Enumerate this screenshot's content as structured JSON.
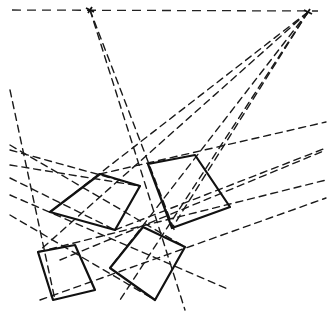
{
  "diagram": {
    "title": "",
    "stroke_color": "#111111",
    "background": "#ffffff",
    "horizon": {
      "x1": 12,
      "y1": 10,
      "x2": 318,
      "y2": 11
    },
    "vanishing_points": [
      {
        "name": "vp-left",
        "x": 90,
        "y": 10
      },
      {
        "name": "vp-right",
        "x": 308,
        "y": 12
      }
    ],
    "quads": [
      {
        "name": "quad-upper-left",
        "points": [
          [
            100,
            174
          ],
          [
            140,
            186
          ],
          [
            115,
            230
          ],
          [
            50,
            212
          ]
        ]
      },
      {
        "name": "quad-upper-right",
        "points": [
          [
            148,
            164
          ],
          [
            195,
            155
          ],
          [
            230,
            207
          ],
          [
            172,
            228
          ]
        ]
      },
      {
        "name": "quad-lower-middle",
        "points": [
          [
            143,
            227
          ],
          [
            185,
            247
          ],
          [
            155,
            300
          ],
          [
            110,
            268
          ]
        ]
      },
      {
        "name": "quad-lower-left",
        "points": [
          [
            38,
            252
          ],
          [
            75,
            245
          ],
          [
            95,
            290
          ],
          [
            53,
            300
          ]
        ]
      }
    ],
    "guides": [
      [
        90,
        10,
        185,
        310
      ],
      [
        90,
        10,
        175,
        232
      ],
      [
        10,
        90,
        55,
        300
      ],
      [
        308,
        12,
        50,
        212
      ],
      [
        308,
        12,
        110,
        268
      ],
      [
        308,
        12,
        172,
        228
      ],
      [
        308,
        12,
        38,
        252
      ],
      [
        308,
        12,
        120,
        300
      ],
      [
        10,
        145,
        185,
        247
      ],
      [
        10,
        165,
        140,
        186
      ],
      [
        10,
        195,
        230,
        290
      ],
      [
        10,
        215,
        155,
        300
      ],
      [
        38,
        252,
        326,
        180
      ],
      [
        60,
        260,
        326,
        150
      ],
      [
        40,
        300,
        326,
        198
      ],
      [
        100,
        174,
        326,
        122
      ],
      [
        115,
        230,
        326,
        148
      ],
      [
        10,
        150,
        140,
        186
      ],
      [
        10,
        178,
        115,
        230
      ]
    ]
  }
}
